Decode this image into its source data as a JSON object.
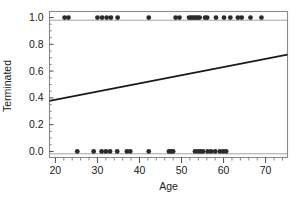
{
  "chart_data": {
    "type": "scatter",
    "title": "",
    "xlabel": "Age",
    "ylabel": "Terminated",
    "xlim": [
      18.6,
      75.2
    ],
    "ylim": [
      -0.045,
      1.045
    ],
    "grid": false,
    "legend": null,
    "x_ticks": [
      20,
      30,
      40,
      50,
      60,
      70
    ],
    "x_tick_labels": [
      "20",
      "30",
      "40",
      "50",
      "60",
      "70"
    ],
    "x_minor_tick_step": 2,
    "y_ticks": [
      0.0,
      0.2,
      0.4,
      0.6,
      0.8,
      1.0
    ],
    "y_tick_labels": [
      "0.0",
      "0.2",
      "0.4",
      "0.6",
      "0.8",
      "1.0"
    ],
    "y_minor_tick_step": 0.05,
    "marker": "circle",
    "marker_color": "#2b2b2b",
    "marker_size": 2.4,
    "series": [
      {
        "name": "Terminated = 1",
        "y": 1.0,
        "x": [
          22.2,
          23.1,
          30.0,
          31.1,
          32.2,
          33.2,
          34.8,
          42.2,
          48.6,
          49.5,
          51.8,
          52.3,
          52.8,
          53.3,
          53.8,
          54.3,
          55.6,
          56.1,
          58.2,
          60.1,
          61.6,
          63.4,
          64.3,
          66.4,
          69.0
        ]
      },
      {
        "name": "Terminated = 0",
        "y": 0.0,
        "x": [
          25.2,
          29.1,
          31.0,
          32.0,
          33.0,
          34.7,
          37.0,
          37.8,
          42.2,
          47.0,
          47.5,
          48.0,
          53.2,
          53.9,
          54.5,
          55.1,
          56.2,
          57.0,
          58.0,
          59.1,
          59.9,
          60.6
        ]
      }
    ],
    "fit_line": {
      "name": "linear fit",
      "color": "#1a1a1a",
      "width": 1.8,
      "x": [
        18.6,
        75.2
      ],
      "y": [
        0.378,
        0.723
      ],
      "slope": 0.0061,
      "intercept": 0.265
    },
    "frame": {
      "color": "#7a7a7a",
      "visible": true
    }
  }
}
